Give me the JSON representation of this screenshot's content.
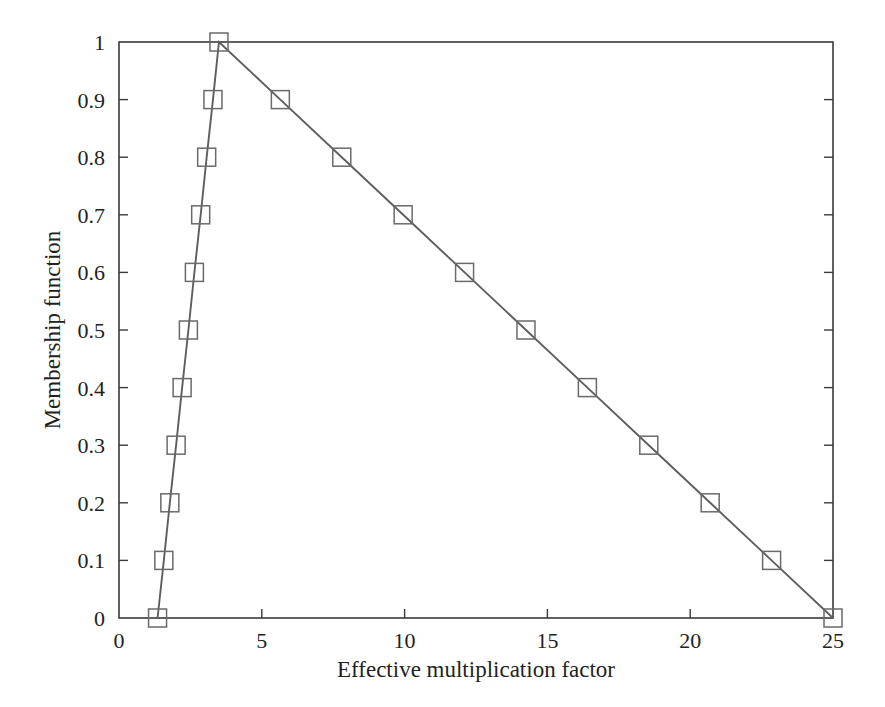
{
  "chart_data": {
    "type": "line",
    "title": "",
    "subtitle": "",
    "xlabel": "Effective multiplication factor",
    "ylabel": "Membership function",
    "xlim": [
      0,
      25
    ],
    "ylim": [
      0,
      1
    ],
    "xticks": [
      0,
      5,
      10,
      15,
      20,
      25
    ],
    "xtick_labels": [
      "0",
      "5",
      "10",
      "15",
      "20",
      "25"
    ],
    "yticks": [
      0,
      0.1,
      0.2,
      0.3,
      0.4,
      0.5,
      0.6,
      0.7,
      0.8,
      0.9,
      1
    ],
    "ytick_labels": [
      "0",
      "0.1",
      "0.2",
      "0.3",
      "0.4",
      "0.5",
      "0.6",
      "0.7",
      "0.8",
      "0.9",
      "1"
    ],
    "grid": false,
    "legend": false,
    "legend_position": "none",
    "marker": "open-square",
    "line_color": "#5e5e5e",
    "marker_color": "#6a6a6a",
    "axis_color": "#3a3a3a",
    "background_color": "#ffffff",
    "annotations": [],
    "series": [
      {
        "name": "Triangular membership function",
        "x": [
          1.35,
          1.57,
          1.78,
          2.0,
          2.21,
          2.43,
          2.64,
          2.86,
          3.07,
          3.29,
          3.5,
          5.65,
          7.8,
          9.95,
          12.1,
          14.25,
          16.4,
          18.55,
          20.7,
          22.85,
          25.0
        ],
        "values": [
          0.0,
          0.1,
          0.2,
          0.3,
          0.4,
          0.5,
          0.6,
          0.7,
          0.8,
          0.9,
          1.0,
          0.9,
          0.8,
          0.7,
          0.6,
          0.5,
          0.4,
          0.3,
          0.2,
          0.1,
          0.0
        ]
      }
    ],
    "peak": {
      "x": 3.5,
      "y": 1.0
    },
    "support": {
      "left": 1.35,
      "right": 25.0
    }
  }
}
